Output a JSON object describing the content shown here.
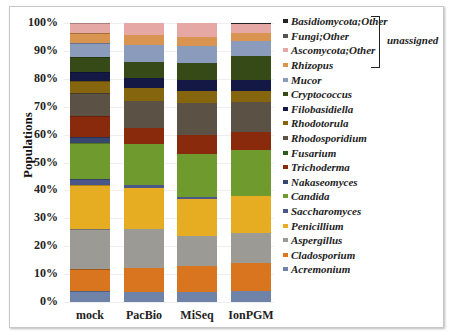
{
  "chart_data": {
    "type": "bar",
    "stacked": true,
    "title": "",
    "xlabel": "",
    "ylabel": "Populations",
    "ylim": [
      0,
      100
    ],
    "yticks": [
      "0%",
      "10%",
      "20%",
      "30%",
      "40%",
      "50%",
      "60%",
      "70%",
      "80%",
      "90%",
      "100%"
    ],
    "categories": [
      "mock",
      "PacBio",
      "MiSeq",
      "IonPGM"
    ],
    "legend_position": "right",
    "legend_group_label": "unassigned",
    "legend_group_members": [
      "Basidiomycota;Other",
      "Fungi;Other",
      "Ascomycota;Other"
    ],
    "series": [
      {
        "name": "Acremonium",
        "color": "#6f82a8",
        "values": [
          4.0,
          3.6,
          3.6,
          3.9
        ]
      },
      {
        "name": "Cladosporium",
        "color": "#d9741f",
        "values": [
          8.0,
          8.6,
          9.3,
          10.0
        ]
      },
      {
        "name": "Aspergillus",
        "color": "#9c9a94",
        "values": [
          14.0,
          14.0,
          10.8,
          10.8
        ]
      },
      {
        "name": "Penicillium",
        "color": "#e6ad23",
        "values": [
          16.0,
          14.7,
          13.3,
          13.3
        ]
      },
      {
        "name": "Saccharomyces",
        "color": "#4a5788",
        "values": [
          2.0,
          1.1,
          0.7,
          0.0
        ]
      },
      {
        "name": "Candida",
        "color": "#6f9a2e",
        "values": [
          13.0,
          14.7,
          15.4,
          16.5
        ]
      },
      {
        "name": "Nakaseomyces",
        "color": "#38456e",
        "values": [
          2.0,
          0.0,
          0.0,
          0.0
        ]
      },
      {
        "name": "Trichoderma",
        "color": "#8a2a0c",
        "values": [
          7.8,
          5.7,
          6.8,
          6.5
        ]
      },
      {
        "name": "Fusarium",
        "color": "#2d5b20",
        "values": [
          0.0,
          0.0,
          0.0,
          0.0
        ]
      },
      {
        "name": "Rhodosporidium",
        "color": "#5b5145",
        "values": [
          8.1,
          9.7,
          11.5,
          10.8
        ]
      },
      {
        "name": "Rhodotorula",
        "color": "#85660f",
        "values": [
          4.3,
          4.7,
          4.3,
          3.9
        ]
      },
      {
        "name": "Filobasidiella",
        "color": "#141845",
        "values": [
          3.2,
          3.6,
          3.9,
          3.9
        ]
      },
      {
        "name": "Cryptococcus",
        "color": "#354a16",
        "values": [
          5.4,
          5.7,
          6.1,
          8.6
        ]
      },
      {
        "name": "Mucor",
        "color": "#8a9bbb",
        "values": [
          5.0,
          6.1,
          6.1,
          5.4
        ]
      },
      {
        "name": "Rhizopus",
        "color": "#d89450",
        "values": [
          3.6,
          3.6,
          3.2,
          2.9
        ]
      },
      {
        "name": "Ascomycota;Other",
        "color": "#e5a8a4",
        "values": [
          3.6,
          4.3,
          5.0,
          3.2
        ]
      },
      {
        "name": "Fungi;Other",
        "color": "#555555",
        "values": [
          0.0,
          0.0,
          0.0,
          0.0
        ]
      },
      {
        "name": "Basidiomycota;Other",
        "color": "#222222",
        "values": [
          0.0,
          0.0,
          0.0,
          0.4
        ]
      }
    ]
  },
  "legend": {
    "items": [
      "Basidiomycota;Other",
      "Fungi;Other",
      "Ascomycota;Other",
      "Rhizopus",
      "Mucor",
      "Cryptococcus",
      "Filobasidiella",
      "Rhodotorula",
      "Rhodosporidium",
      "Fusarium",
      "Trichoderma",
      "Nakaseomyces",
      "Candida",
      "Saccharomyces",
      "Penicillium",
      "Aspergillus",
      "Cladosporium",
      "Acremonium"
    ],
    "unassigned_label": "unassigned"
  }
}
